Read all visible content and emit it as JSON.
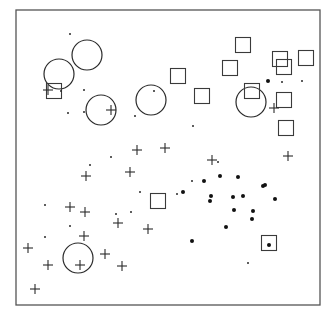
{
  "chart_data": {
    "type": "scatter",
    "title": "",
    "xlabel": "",
    "ylabel": "",
    "grid": false,
    "legend": null,
    "frame": {
      "x": 16,
      "y": 10,
      "width": 304,
      "height": 295
    },
    "series": [
      {
        "name": "circles",
        "marker": "circle",
        "radius": 15,
        "points": [
          [
            59,
            74
          ],
          [
            87,
            55
          ],
          [
            101,
            110
          ],
          [
            151,
            100
          ],
          [
            251,
            102
          ],
          [
            78,
            258
          ]
        ]
      },
      {
        "name": "squares",
        "marker": "square",
        "size": 15,
        "points": [
          [
            54,
            91
          ],
          [
            178,
            76
          ],
          [
            202,
            96
          ],
          [
            243,
            45
          ],
          [
            230,
            68
          ],
          [
            280,
            59
          ],
          [
            284,
            67
          ],
          [
            306,
            58
          ],
          [
            284,
            100
          ],
          [
            252,
            91
          ],
          [
            286,
            128
          ],
          [
            158,
            201
          ],
          [
            269,
            243
          ]
        ]
      },
      {
        "name": "crosses",
        "marker": "plus",
        "size": 10,
        "points": [
          [
            48,
            90
          ],
          [
            111,
            110
          ],
          [
            274,
            108
          ],
          [
            137,
            150
          ],
          [
            165,
            148
          ],
          [
            212,
            160
          ],
          [
            288,
            156
          ],
          [
            86,
            176
          ],
          [
            130,
            172
          ],
          [
            70,
            207
          ],
          [
            85,
            212
          ],
          [
            118,
            223
          ],
          [
            148,
            229
          ],
          [
            84,
            236
          ],
          [
            28,
            248
          ],
          [
            105,
            254
          ],
          [
            48,
            265
          ],
          [
            80,
            265
          ],
          [
            122,
            266
          ],
          [
            35,
            289
          ]
        ]
      },
      {
        "name": "small-dots",
        "marker": "dot",
        "radius": 1,
        "points": [
          [
            70,
            34
          ],
          [
            84,
            90
          ],
          [
            84,
            112
          ],
          [
            68,
            113
          ],
          [
            154,
            91
          ],
          [
            135,
            116
          ],
          [
            193,
            126
          ],
          [
            111,
            157
          ],
          [
            90,
            165
          ],
          [
            45,
            205
          ],
          [
            45,
            237
          ],
          [
            70,
            226
          ],
          [
            131,
            212
          ],
          [
            140,
            192
          ],
          [
            177,
            194
          ],
          [
            218,
            162
          ],
          [
            248,
            263
          ],
          [
            282,
            82
          ],
          [
            302,
            81
          ],
          [
            192,
            181
          ],
          [
            116,
            214
          ],
          [
            61,
            91
          ]
        ]
      },
      {
        "name": "large-dots",
        "marker": "dot",
        "radius": 2,
        "points": [
          [
            268,
            81
          ],
          [
            204,
            181
          ],
          [
            220,
            176
          ],
          [
            238,
            177
          ],
          [
            263,
            186
          ],
          [
            265,
            185
          ],
          [
            275,
            199
          ],
          [
            183,
            192
          ],
          [
            211,
            196
          ],
          [
            210,
            201
          ],
          [
            233,
            197
          ],
          [
            243,
            196
          ],
          [
            253,
            211
          ],
          [
            234,
            210
          ],
          [
            252,
            219
          ],
          [
            226,
            227
          ],
          [
            192,
            241
          ],
          [
            269,
            245
          ]
        ]
      }
    ]
  }
}
